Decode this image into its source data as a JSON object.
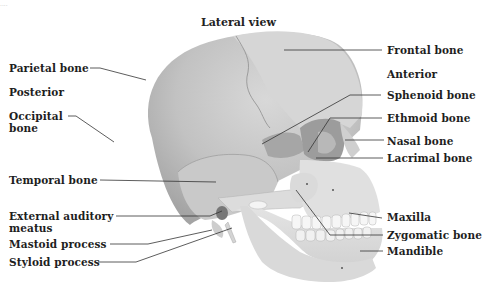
{
  "diagram": {
    "title": "Lateral view",
    "corner_mark": "....",
    "colors": {
      "background": "#ffffff",
      "text": "#1e1e1e",
      "leader_line": "#333333",
      "cranium_dark": "#a8a8a8",
      "cranium_light": "#cfcfcf",
      "face_bone": "#e2e2e2",
      "teeth": "#f5f5f5"
    },
    "orientation_labels": {
      "posterior": "Posterior",
      "anterior": "Anterior"
    },
    "labels_left": [
      {
        "id": "parietal",
        "text": "Parietal bone"
      },
      {
        "id": "occipital_1",
        "text": "Occipital"
      },
      {
        "id": "occipital_2",
        "text": "bone"
      },
      {
        "id": "temporal",
        "text": "Temporal bone"
      },
      {
        "id": "ext_aud_1",
        "text": "External auditory"
      },
      {
        "id": "ext_aud_2",
        "text": "meatus"
      },
      {
        "id": "mastoid",
        "text": "Mastoid process"
      },
      {
        "id": "styloid",
        "text": "Styloid process"
      }
    ],
    "labels_right": [
      {
        "id": "frontal",
        "text": "Frontal bone"
      },
      {
        "id": "sphenoid",
        "text": "Sphenoid bone"
      },
      {
        "id": "ethmoid",
        "text": "Ethmoid bone"
      },
      {
        "id": "nasal",
        "text": "Nasal bone"
      },
      {
        "id": "lacrimal",
        "text": "Lacrimal bone"
      },
      {
        "id": "maxilla",
        "text": "Maxilla"
      },
      {
        "id": "zygomatic",
        "text": "Zygomatic bone"
      },
      {
        "id": "mandible",
        "text": "Mandible"
      }
    ]
  }
}
